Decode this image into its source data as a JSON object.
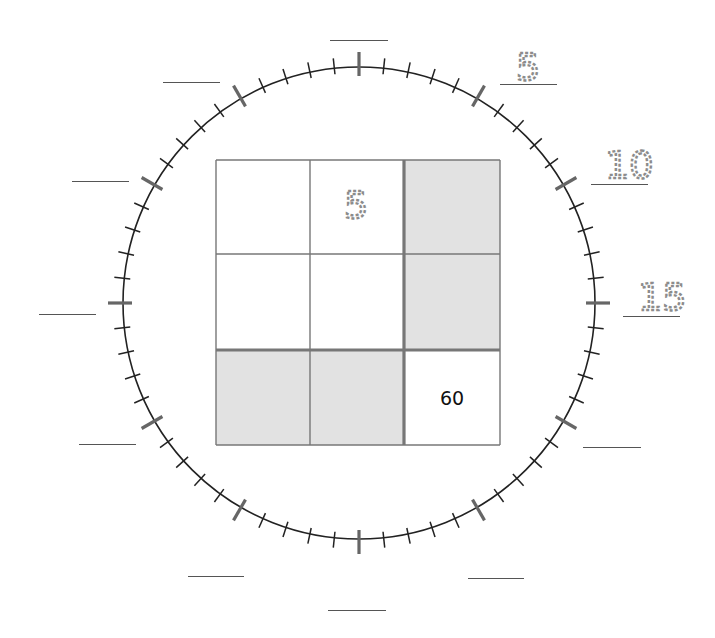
{
  "worksheet": {
    "clock": {
      "center": [
        359,
        303
      ],
      "radius": 236,
      "minor_ticks": 60,
      "major_every": 5,
      "tick_color": "#222222",
      "major_tick_color": "#666666"
    },
    "clock_labels": [
      {
        "position": 0,
        "value": "",
        "blank": {
          "x1": 330,
          "x2": 388,
          "y": 40
        }
      },
      {
        "position": 5,
        "value": "5",
        "blank": {
          "x1": 500,
          "x2": 557,
          "y": 84
        },
        "digit": {
          "x": 514,
          "y": 44
        }
      },
      {
        "position": 10,
        "value": "10",
        "blank": {
          "x1": 591,
          "x2": 648,
          "y": 184
        },
        "digit": {
          "x": 603,
          "y": 142
        }
      },
      {
        "position": 15,
        "value": "15",
        "blank": {
          "x1": 623,
          "x2": 680,
          "y": 316
        },
        "digit": {
          "x": 636,
          "y": 274
        }
      },
      {
        "position": 20,
        "value": "",
        "blank": {
          "x1": 583,
          "x2": 641,
          "y": 447
        }
      },
      {
        "position": 25,
        "value": "",
        "blank": {
          "x1": 468,
          "x2": 524,
          "y": 578
        }
      },
      {
        "position": 30,
        "value": "",
        "blank": {
          "x1": 328,
          "x2": 386,
          "y": 610
        }
      },
      {
        "position": 35,
        "value": "",
        "blank": {
          "x1": 188,
          "x2": 244,
          "y": 576
        }
      },
      {
        "position": 40,
        "value": "",
        "blank": {
          "x1": 79,
          "x2": 136,
          "y": 444
        }
      },
      {
        "position": 45,
        "value": "",
        "blank": {
          "x1": 39,
          "x2": 96,
          "y": 314
        }
      },
      {
        "position": 50,
        "value": "",
        "blank": {
          "x1": 72,
          "x2": 129,
          "y": 181
        }
      },
      {
        "position": 55,
        "value": "",
        "blank": {
          "x1": 163,
          "x2": 220,
          "y": 82
        }
      }
    ],
    "grid": {
      "rows": 3,
      "cols": 3,
      "shaded_color": "#e2e2e2",
      "line_color": "#777777",
      "cells": [
        [
          {
            "value": "",
            "shaded": false,
            "style": "blank"
          },
          {
            "value": "5",
            "shaded": false,
            "style": "dotted"
          },
          {
            "value": "",
            "shaded": true,
            "style": "blank"
          }
        ],
        [
          {
            "value": "",
            "shaded": false,
            "style": "blank"
          },
          {
            "value": "",
            "shaded": false,
            "style": "blank"
          },
          {
            "value": "",
            "shaded": true,
            "style": "blank"
          }
        ],
        [
          {
            "value": "",
            "shaded": true,
            "style": "blank"
          },
          {
            "value": "",
            "shaded": true,
            "style": "blank"
          },
          {
            "value": "60",
            "shaded": false,
            "style": "given"
          }
        ]
      ]
    }
  }
}
